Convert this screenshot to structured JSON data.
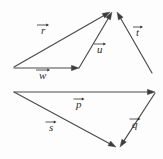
{
  "figure": {
    "background_color": "#fdfdfd",
    "line_color": "#4a4a4a",
    "arrowhead_color": "#3d3d3d",
    "width": 163,
    "height": 159
  },
  "chart_data": {
    "type": "diagram",
    "xlabel": "",
    "ylabel": "",
    "xlim": [
      0,
      163
    ],
    "ylim": [
      0,
      159
    ],
    "grid": false,
    "legend": "none",
    "coordinate_note": "Pixel coordinates, origin at top-left of the 163x159 image.",
    "groups": [
      {
        "name": "upper-triangle",
        "description": "Vectors r, w and u form a closed triangle whose apex is shared with vector t; r, u and t all point to the common apex.",
        "apex": [
          113,
          11
        ],
        "vectors": [
          "r",
          "w",
          "u",
          "t"
        ]
      },
      {
        "name": "lower-triangle",
        "description": "Vectors p, s and q form a triangle; s and q both point to the shared bottom vertex.",
        "shared_vertex": [
          118,
          147
        ],
        "vectors": [
          "p",
          "s",
          "q"
        ]
      }
    ],
    "vectors": [
      {
        "name": "r",
        "label": "r",
        "group": "upper-triangle",
        "start": [
          14,
          67
        ],
        "end": [
          110,
          12
        ],
        "arrow_at": "end",
        "label_pos": [
          46,
          27
        ]
      },
      {
        "name": "w",
        "label": "w",
        "group": "upper-triangle",
        "start": [
          14,
          68
        ],
        "end": [
          79,
          68
        ],
        "arrow_at": "end",
        "label_pos": [
          44,
          72
        ]
      },
      {
        "name": "u",
        "label": "u",
        "group": "upper-triangle",
        "start": [
          79,
          68
        ],
        "end": [
          112,
          12
        ],
        "arrow_at": "end",
        "label_pos": [
          102,
          46
        ]
      },
      {
        "name": "t",
        "label": "t",
        "group": "upper-triangle",
        "start": [
          152,
          73
        ],
        "end": [
          117,
          12
        ],
        "arrow_at": "end",
        "label_pos": [
          141,
          29
        ]
      },
      {
        "name": "p",
        "label": "p",
        "group": "lower-triangle",
        "start": [
          14,
          92
        ],
        "end": [
          155,
          92
        ],
        "arrow_at": "end",
        "label_pos": [
          81,
          101
        ]
      },
      {
        "name": "s",
        "label": "s",
        "group": "lower-triangle",
        "start": [
          14,
          92
        ],
        "end": [
          116,
          147
        ],
        "arrow_at": "end",
        "label_pos": [
          54,
          124
        ]
      },
      {
        "name": "q",
        "label": "q",
        "group": "lower-triangle",
        "start": [
          155,
          93
        ],
        "end": [
          120,
          147
        ],
        "arrow_at": "end",
        "label_pos": [
          137,
          121
        ]
      }
    ]
  },
  "labels": {
    "r": {
      "glyph": "r",
      "accent": "vector-arrow"
    },
    "w": {
      "glyph": "w",
      "accent": "vector-arrow"
    },
    "u": {
      "glyph": "u",
      "accent": "vector-arrow"
    },
    "t": {
      "glyph": "t",
      "accent": "vector-arrow"
    },
    "p": {
      "glyph": "p",
      "accent": "vector-arrow"
    },
    "s": {
      "glyph": "s",
      "accent": "vector-arrow"
    },
    "q": {
      "glyph": "q",
      "accent": "vector-arrow"
    }
  }
}
